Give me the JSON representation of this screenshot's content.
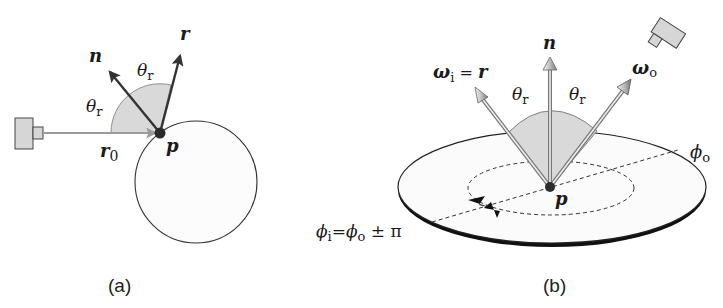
{
  "figure": {
    "panels": [
      {
        "id": "a",
        "caption": "(a)",
        "labels": {
          "normal": "n",
          "reflected": "r",
          "incident": "r",
          "incident_sub": "0",
          "point": "p",
          "theta_left": "θ",
          "theta_left_sub": "r",
          "theta_right": "θ",
          "theta_right_sub": "r"
        },
        "elements": [
          "camera",
          "incident ray r0",
          "sphere",
          "normal n",
          "reflected ray r",
          "angle wedge"
        ]
      },
      {
        "id": "b",
        "caption": "(b)",
        "labels": {
          "normal": "n",
          "omega_i": "ω",
          "omega_i_sub": "i",
          "omega_i_eq": " = ",
          "omega_i_rhs": "r",
          "omega_o": "ω",
          "omega_o_sub": "o",
          "theta_left": "θ",
          "theta_left_sub": "r",
          "theta_right": "θ",
          "theta_right_sub": "r",
          "point": "p",
          "phi_o": "ϕ",
          "phi_o_sub": "o",
          "phi_i": "ϕ",
          "phi_i_sub": "i",
          "phi_eq": "=",
          "phi_rhs": "ϕ",
          "phi_rhs_sub": "o",
          "phi_pm": " ± π"
        },
        "elements": [
          "surface disk",
          "azimuth dashed circle",
          "normal n",
          "incident ω_i",
          "outgoing ω_o",
          "camera",
          "angle wedge",
          "azimuth arrows"
        ]
      }
    ],
    "colors": {
      "stroke": "#1a1a1a",
      "wedge_fill": "#d9d9d9",
      "ray_gray": "#8c8c8c",
      "camera_fill": "#d6d6d6",
      "point": "#2b2b2b"
    }
  }
}
